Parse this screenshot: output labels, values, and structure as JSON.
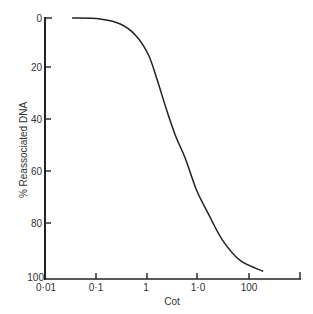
{
  "chart_data": {
    "type": "line",
    "title": "",
    "xlabel": "Cot",
    "ylabel": "% Reassociated DNA",
    "x_scale": "log",
    "x_tick_labels": [
      "0·01",
      "0·1",
      "1",
      "1·0",
      "100",
      ""
    ],
    "y_tick_labels": [
      "0",
      "20",
      "40",
      "60",
      "80",
      "100"
    ],
    "y_inverted": true,
    "xlim": [
      0.01,
      1000
    ],
    "ylim": [
      0,
      100
    ],
    "grid": false,
    "legend": null,
    "series": [
      {
        "name": "reassociation curve",
        "x": [
          0.034,
          0.12,
          0.3,
          0.59,
          1.06,
          1.6,
          2.4,
          3.6,
          5.7,
          9.4,
          16,
          30,
          68,
          190
        ],
        "y": [
          0,
          0.4,
          2.3,
          6.5,
          14,
          24,
          35,
          45,
          54,
          66,
          75,
          85,
          93,
          97
        ]
      }
    ],
    "color": "#222222"
  },
  "axes": {
    "x_label": "Cot",
    "y_label": "% Reassociated DNA"
  }
}
